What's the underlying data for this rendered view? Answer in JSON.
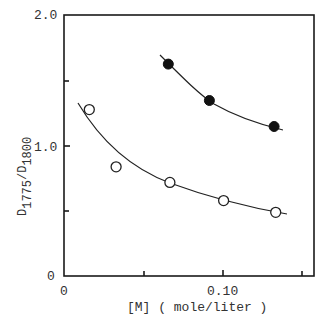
{
  "chart_data": {
    "type": "scatter",
    "title": "",
    "xlabel": "[M] ( mole/liter )",
    "ylabel": "D1775/D1800",
    "ylabel_parts": {
      "d1": "D",
      "sub1": "1775",
      "slash": "/",
      "d2": "D",
      "sub2": "1800"
    },
    "xlim": [
      0,
      0.158
    ],
    "ylim": [
      0,
      2.0
    ],
    "x_tick_labels": [
      {
        "value": 0,
        "label": "0"
      },
      {
        "value": 0.1,
        "label": "0.10"
      }
    ],
    "x_ticks": [
      0.05,
      0.1,
      0.15
    ],
    "y_tick_labels": [
      {
        "value": 0,
        "label": "0"
      },
      {
        "value": 1.0,
        "label": "1.0"
      },
      {
        "value": 2.0,
        "label": "2.0"
      }
    ],
    "y_ticks": [
      0.5,
      1.0,
      1.5
    ],
    "grid": false,
    "legend": null,
    "series": [
      {
        "name": "filled circles",
        "marker": "filled-circle",
        "points": [
          {
            "x": 0.066,
            "y": 1.63
          },
          {
            "x": 0.092,
            "y": 1.35
          },
          {
            "x": 0.133,
            "y": 1.15
          }
        ],
        "fit_curve": true
      },
      {
        "name": "open circles",
        "marker": "open-circle",
        "points": [
          {
            "x": 0.016,
            "y": 1.28
          },
          {
            "x": 0.033,
            "y": 0.84
          },
          {
            "x": 0.067,
            "y": 0.72
          },
          {
            "x": 0.101,
            "y": 0.58
          },
          {
            "x": 0.134,
            "y": 0.49
          }
        ],
        "fit_curve": true
      }
    ]
  }
}
